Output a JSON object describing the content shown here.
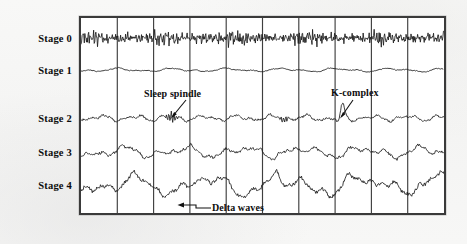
{
  "figure": {
    "background_color": "#f7f7f6",
    "plot_background_color": "#ffffff",
    "border_color": "#3a3a3a",
    "trace_color": "#1b1b1b",
    "column_count": 10
  },
  "stage_labels": [
    {
      "id": "stage-0",
      "label": "Stage 0"
    },
    {
      "id": "stage-1",
      "label": "Stage 1"
    },
    {
      "id": "stage-2",
      "label": "Stage 2"
    },
    {
      "id": "stage-3",
      "label": "Stage 3"
    },
    {
      "id": "stage-4",
      "label": "Stage 4"
    }
  ],
  "annotations": [
    {
      "id": "sleep-spindle",
      "label": "Sleep spindle"
    },
    {
      "id": "k-complex",
      "label": "K-complex"
    },
    {
      "id": "delta-waves",
      "label": "Delta waves"
    }
  ],
  "chart_data": {
    "type": "line",
    "xlabel": "",
    "ylabel": "",
    "grid": true,
    "legend_position": "none",
    "x_range": [
      0,
      367
    ],
    "column_divider_count": 9,
    "annotations": [
      {
        "text": "Sleep spindle",
        "series": "Stage 2",
        "arrow_to_x": 172,
        "arrow_to_y": 116
      },
      {
        "text": "K-complex",
        "series": "Stage 2",
        "arrow_to_x": 341,
        "arrow_to_y": 117
      },
      {
        "text": "Delta waves",
        "series": "Stage 4",
        "arrow_to_x": 178,
        "arrow_to_y": 205
      }
    ],
    "series": [
      {
        "name": "Stage 0",
        "description": "Awake: low-amplitude high-frequency beta activity",
        "baseline_y": 38,
        "amplitude": 5.5,
        "dominant_frequency": "beta (14-30 Hz)"
      },
      {
        "name": "Stage 1",
        "description": "Drowsy: very low amplitude mixed theta activity",
        "baseline_y": 70,
        "amplitude": 2.0,
        "dominant_frequency": "theta (4-7 Hz)"
      },
      {
        "name": "Stage 2",
        "description": "Light sleep: sleep spindles and K-complexes on theta background",
        "baseline_y": 118,
        "amplitude": 4.0,
        "dominant_frequency": "theta with spindles (12-14 Hz)"
      },
      {
        "name": "Stage 3",
        "description": "Deep sleep: moderate delta activity",
        "baseline_y": 152,
        "amplitude": 7.0,
        "dominant_frequency": "delta (1-4 Hz)"
      },
      {
        "name": "Stage 4",
        "description": "Deepest sleep: high-amplitude slow delta waves",
        "baseline_y": 185,
        "amplitude": 12.0,
        "dominant_frequency": "delta (0.5-2 Hz)"
      }
    ]
  }
}
